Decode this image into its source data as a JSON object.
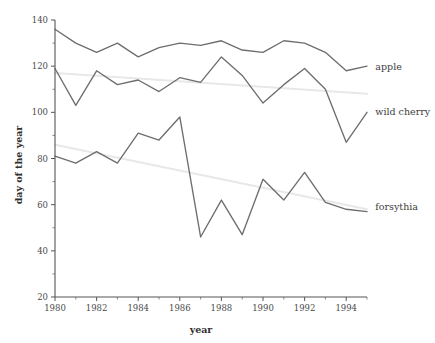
{
  "chart_data": {
    "type": "line",
    "title": "",
    "xlabel": "year",
    "ylabel": "day of the year",
    "xlim": [
      1980,
      1995
    ],
    "ylim": [
      20,
      140
    ],
    "grid": false,
    "legend_position": "right-inline-labels",
    "x": [
      1980,
      1981,
      1982,
      1983,
      1984,
      1985,
      1986,
      1987,
      1988,
      1989,
      1990,
      1991,
      1992,
      1993,
      1994,
      1995
    ],
    "xticks_major": [
      1980,
      1982,
      1984,
      1986,
      1988,
      1990,
      1992,
      1994
    ],
    "xticklabels": [
      "1980",
      "1982",
      "1984",
      "1986",
      "1988",
      "1990",
      "1992",
      "1994"
    ],
    "xticks_minor": [
      1981,
      1983,
      1985,
      1987,
      1989,
      1991,
      1993,
      1995
    ],
    "yticks_major": [
      20,
      40,
      60,
      80,
      100,
      120,
      140
    ],
    "yticklabels": [
      "20",
      "40",
      "60",
      "80",
      "100",
      "120",
      "140"
    ],
    "yticks_minor": [
      30,
      50,
      70,
      90,
      110,
      130
    ],
    "series": [
      {
        "name": "apple",
        "label": "apple",
        "color": "#6e6e6e",
        "label_x": 1995.4,
        "label_y": 119.5,
        "values": [
          136,
          130,
          126,
          130,
          124,
          128,
          130,
          129,
          131,
          127,
          126,
          131,
          130,
          126,
          118,
          120
        ]
      },
      {
        "name": "wild cherry",
        "label": "wild cherry",
        "color": "#6e6e6e",
        "label_x": 1995.4,
        "label_y": 100.0,
        "values": [
          119,
          103,
          118,
          112,
          114,
          109,
          115,
          113,
          124,
          116,
          104,
          112,
          119,
          110,
          87,
          100
        ]
      },
      {
        "name": "forsythia",
        "label": "forsythia",
        "color": "#6e6e6e",
        "label_x": 1995.4,
        "label_y": 59.0,
        "values": [
          81,
          78,
          83,
          78,
          91,
          88,
          98,
          46,
          62,
          47,
          71,
          62,
          74,
          61,
          58,
          57
        ]
      }
    ],
    "trend_lines": [
      {
        "name": "apple-trend",
        "color": "#e8e8e8",
        "x0": 1980,
        "y0": 117,
        "x1": 1995,
        "y1": 108
      },
      {
        "name": "wild-cherry-trend",
        "color": "#e8e8e8",
        "x0": 1980,
        "y0": 86,
        "x1": 1995,
        "y1": 58
      }
    ]
  },
  "axes": {
    "xlabel": "year",
    "ylabel": "day of the year"
  }
}
